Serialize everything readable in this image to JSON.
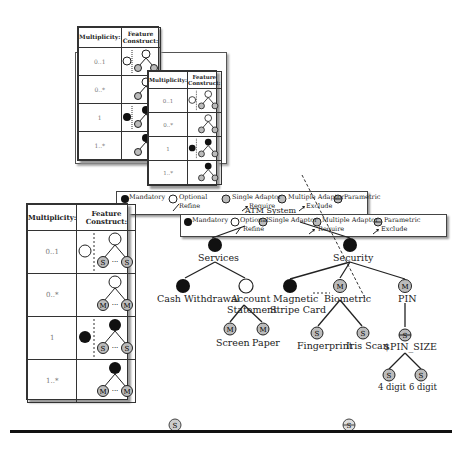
{
  "multiplicity_table": {
    "header_multiplicity": "Multiplicity:",
    "header_feature_construct": "Feature Construct:",
    "rows": [
      {
        "multiplicity": "0..1",
        "construct": "optional-with-single-adaptor-children",
        "child_glyph": "S"
      },
      {
        "multiplicity": "0..*",
        "construct": "optional-with-multiple-adaptor-children",
        "child_glyph": "M"
      },
      {
        "multiplicity": "1",
        "construct": "mandatory-with-single-adaptor-children",
        "child_glyph": "S"
      },
      {
        "multiplicity": "1..*",
        "construct": "mandatory-with-multiple-adaptor-children",
        "child_glyph": "M"
      }
    ],
    "ellipsis": "..."
  },
  "legend": {
    "mandatory": "Mandatory",
    "optional": "Optional",
    "single_adaptor": "Single Adaptor",
    "multiple_adaptor": "Multiple Adaptor",
    "parametric": "Parametric",
    "refine": "Refine",
    "require": "Require",
    "exclude": "Exclude",
    "glyph_single": "S",
    "glyph_multiple": "M"
  },
  "feature_model": {
    "root": "ATM System",
    "nodes": {
      "services": "Services",
      "security": "Security",
      "cash_withdrawal": "Cash Withdrawal",
      "account_statement_1": "Account",
      "account_statement_2": "Statement",
      "screen": "Screen",
      "paper": "Paper",
      "magnetic_1": "Magnetic",
      "magnetic_2": "Stripe Card",
      "biometric": "Biometric",
      "pin": "PIN",
      "fingerprint": "Fingerprint",
      "iris_scan": "Iris Scan",
      "pin_size": "$PIN_SIZE",
      "digit4": "4 digit",
      "digit6": "6 digit"
    }
  },
  "footer_icons": {
    "single_adaptor_glyph": "S",
    "parametric_glyph": "S"
  },
  "colors": {
    "mandatory": "#111111",
    "adaptor_fill": "#bbbbbb",
    "line": "#222222",
    "multiplicity_text": "#777777"
  }
}
